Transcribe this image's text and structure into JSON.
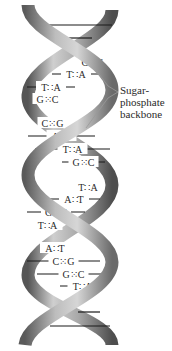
{
  "diagram": {
    "label": {
      "lines": [
        "Sugar-",
        "phosphate",
        "backbone"
      ]
    },
    "base_pairs": [
      {
        "y": 25,
        "left": "",
        "right": "",
        "x1": 37,
        "x2": 112,
        "visible_text": false
      },
      {
        "y": 38,
        "left": "",
        "right": "",
        "x1": 62,
        "x2": 92,
        "visible_text": false
      },
      {
        "y": 62,
        "left": "C",
        "right": "G",
        "x1": 82,
        "x2": 103,
        "visible_text": true
      },
      {
        "y": 74,
        "left": "T",
        "right": "A",
        "x1": 52,
        "x2": 100,
        "visible_text": true
      },
      {
        "y": 87,
        "left": "T",
        "right": "A",
        "x1": 27,
        "x2": 75,
        "visible_text": true
      },
      {
        "y": 99,
        "left": "G",
        "right": "C",
        "x1": 35,
        "x2": 60,
        "visible_text": true
      },
      {
        "y": 123,
        "left": "C",
        "right": "G",
        "x1": 40,
        "x2": 65,
        "visible_text": true
      },
      {
        "y": 136,
        "left": "A",
        "right": "T",
        "x1": 28,
        "x2": 95,
        "visible_text": true
      },
      {
        "y": 149,
        "left": "T",
        "right": "A",
        "x1": 35,
        "x2": 110,
        "visible_text": true
      },
      {
        "y": 162,
        "left": "G",
        "right": "C",
        "x1": 62,
        "x2": 105,
        "visible_text": true
      },
      {
        "y": 187,
        "left": "T",
        "right": "A",
        "x1": 78,
        "x2": 98,
        "visible_text": true
      },
      {
        "y": 199,
        "left": "A",
        "right": "T",
        "x1": 48,
        "x2": 100,
        "visible_text": true
      },
      {
        "y": 212,
        "left": "G",
        "right": "C",
        "x1": 27,
        "x2": 85,
        "visible_text": true
      },
      {
        "y": 225,
        "left": "T",
        "right": "A",
        "x1": 35,
        "x2": 60,
        "visible_text": true
      },
      {
        "y": 248,
        "left": "A",
        "right": "T",
        "x1": 42,
        "x2": 68,
        "visible_text": true
      },
      {
        "y": 261,
        "left": "C",
        "right": "G",
        "x1": 27,
        "x2": 100,
        "visible_text": true
      },
      {
        "y": 274,
        "left": "G",
        "right": "C",
        "x1": 37,
        "x2": 110,
        "visible_text": true
      },
      {
        "y": 286,
        "left": "T",
        "right": "A",
        "x1": 60,
        "x2": 105,
        "visible_text": true
      },
      {
        "y": 312,
        "left": "",
        "right": "",
        "x1": 78,
        "x2": 100,
        "visible_text": false
      },
      {
        "y": 326,
        "left": "",
        "right": "",
        "x1": 50,
        "x2": 110,
        "visible_text": false
      }
    ],
    "colors": {
      "ribbon_light": "#c8c8c8",
      "ribbon_mid": "#9a9a9a",
      "ribbon_dark": "#5a5a5a",
      "text": "#2a2a2a",
      "leader": "#999999"
    }
  }
}
